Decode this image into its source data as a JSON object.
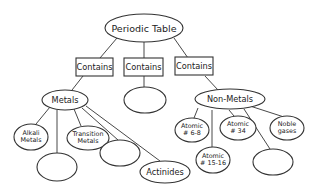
{
  "diagram": {
    "type": "concept-map",
    "root": {
      "label": "Periodic Table"
    },
    "connectors": [
      {
        "label": "Contains"
      },
      {
        "label": "Contains"
      },
      {
        "label": "Contains"
      }
    ],
    "categories": [
      {
        "label": "Metals"
      },
      {
        "label": ""
      },
      {
        "label": "Non-Metals"
      }
    ],
    "metals_children": [
      {
        "line1": "Alkali",
        "line2": "Metals"
      },
      {
        "line1": "Transition",
        "line2": "Metals"
      },
      {
        "line1": "",
        "line2": ""
      },
      {
        "line1": "",
        "line2": ""
      },
      {
        "line1": "Actinides",
        "line2": ""
      }
    ],
    "nonmetals_children": [
      {
        "line1": "Atomic",
        "line2": "# 6-8"
      },
      {
        "line1": "Atomic",
        "line2": "# 34"
      },
      {
        "line1": "Noble",
        "line2": "gases"
      },
      {
        "line1": "Atomic",
        "line2": "# 15-16"
      },
      {
        "line1": "",
        "line2": ""
      }
    ]
  }
}
